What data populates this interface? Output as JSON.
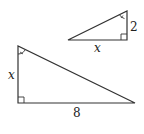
{
  "diagram": {
    "type": "similar-right-triangles",
    "small_triangle": {
      "vertical_leg_label": "2",
      "horizontal_leg_label": "x",
      "marked_angle": "top vertex (single arc)",
      "right_angle": "bottom-right"
    },
    "large_triangle": {
      "vertical_leg_label": "x",
      "horizontal_leg_label": "8",
      "marked_angle": "top vertex (single arc)",
      "right_angle": "bottom-left"
    },
    "stroke_color": "#333333"
  }
}
